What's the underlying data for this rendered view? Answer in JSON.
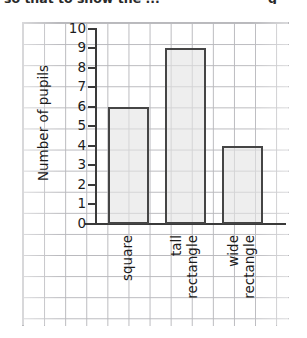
{
  "page": {
    "cropped_header_left": "so that to show the ...",
    "cropped_header_right": "g"
  },
  "chart_data": {
    "type": "bar",
    "title": "",
    "xlabel": "",
    "ylabel": "Number of pupils",
    "categories": [
      "square",
      "tall rectangle",
      "wide rectangle"
    ],
    "category_lines": [
      [
        "square"
      ],
      [
        "tall",
        "rectangle"
      ],
      [
        "wide",
        "rectangle"
      ]
    ],
    "values": [
      6,
      9,
      4
    ],
    "ylim": [
      0,
      10
    ],
    "yticks": [
      0,
      1,
      2,
      3,
      4,
      5,
      6,
      7,
      8,
      9,
      10
    ],
    "ytick_labels": [
      "0",
      "1",
      "2",
      "3",
      "4",
      "5",
      "6",
      "7",
      "8",
      "9",
      "10"
    ],
    "grid": true,
    "grid_style": "graph-paper",
    "legend": "none",
    "bar_fill_color": "#e4e4e4",
    "bar_edge_color": "#454545",
    "axis_color": "#3a3a3a",
    "grid_color": "#b9b9bd"
  }
}
